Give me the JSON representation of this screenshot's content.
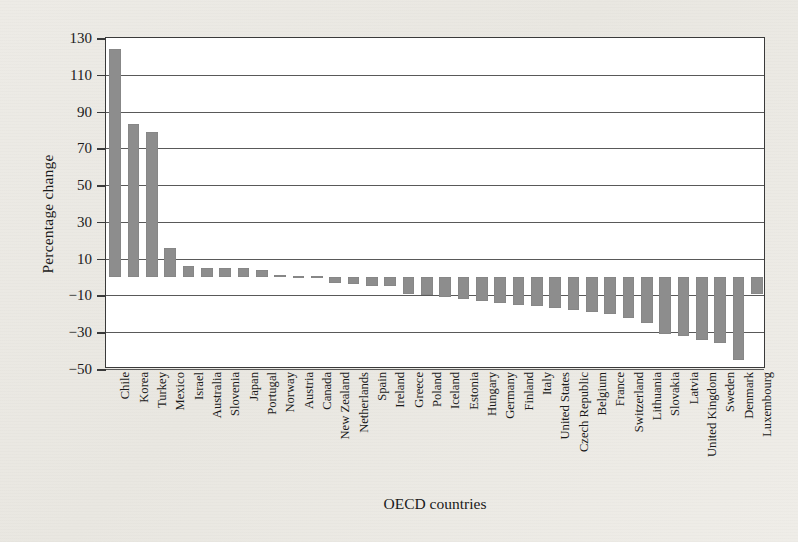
{
  "chart_data": {
    "type": "bar",
    "title": "",
    "xlabel": "OECD countries",
    "ylabel": "Percentage change",
    "ylim": [
      -50,
      130
    ],
    "yticks": [
      130,
      110,
      90,
      70,
      50,
      30,
      10,
      -10,
      -30,
      -50
    ],
    "ytick_labels": [
      "130",
      "110",
      "90",
      "70",
      "50",
      "30",
      "10",
      "−10",
      "−30",
      "−50"
    ],
    "grid": true,
    "legend": "none",
    "bar_color": "#8d8d8d",
    "categories": [
      "Chile",
      "Korea",
      "Turkey",
      "Mexico",
      "Israel",
      "Australia",
      "Slovenia",
      "Japan",
      "Portugal",
      "Norway",
      "Austria",
      "Canada",
      "New Zealand",
      "Netherlands",
      "Spain",
      "Ireland",
      "Greece",
      "Poland",
      "Iceland",
      "Estonia",
      "Hungary",
      "Germany",
      "Finland",
      "Italy",
      "United States",
      "Czech Republic",
      "Belgium",
      "France",
      "Switzerland",
      "Lithuania",
      "Slovakia",
      "Latvia",
      "United Kingdom",
      "Sweden",
      "Denmark",
      "Luxembourg"
    ],
    "values": [
      124,
      83,
      79,
      16,
      6,
      5,
      5,
      5,
      4,
      1,
      0.5,
      0.5,
      -3,
      -4,
      -5,
      -5,
      -9,
      -10,
      -11,
      -12,
      -13,
      -14,
      -15,
      -16,
      -17,
      -18,
      -19,
      -20,
      -22,
      -25,
      -31,
      -32,
      -34,
      -36,
      -45,
      -9
    ]
  }
}
